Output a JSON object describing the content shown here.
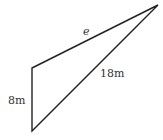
{
  "diagram": {
    "type": "triangle",
    "vertices": {
      "top_left": [
        32,
        68
      ],
      "bottom_left": [
        32,
        131
      ],
      "top_right": [
        158,
        5
      ]
    },
    "labels": {
      "side_e": "e",
      "hypotenuse": "18m",
      "vertical_side": "8m"
    },
    "stroke_color": "#222222"
  }
}
